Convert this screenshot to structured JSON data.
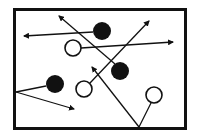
{
  "diagram": {
    "width": 197,
    "height": 136,
    "stroke_color": "#111111",
    "background": "#ffffff",
    "frame": {
      "x": 14.5,
      "y": 9.5,
      "width": 171,
      "height": 119,
      "stroke_width": 3
    },
    "filled_circles": [
      {
        "id": "filled-top",
        "cx": 102,
        "cy": 31,
        "r": 9
      },
      {
        "id": "filled-middle",
        "cx": 120,
        "cy": 71,
        "r": 9
      },
      {
        "id": "filled-left",
        "cx": 55,
        "cy": 84,
        "r": 9
      }
    ],
    "open_circles": [
      {
        "id": "open-top",
        "cx": 73,
        "cy": 48,
        "r": 8
      },
      {
        "id": "open-lower-middle",
        "cx": 84,
        "cy": 89,
        "r": 8
      },
      {
        "id": "open-right",
        "cx": 154,
        "cy": 95,
        "r": 8
      }
    ],
    "arrows": [
      {
        "id": "arrow-top-left",
        "x1": 93,
        "y1": 32,
        "x2": 24,
        "y2": 36,
        "head": true
      },
      {
        "id": "arrow-diagonal-upleft",
        "x1": 115,
        "y1": 64,
        "x2": 59,
        "y2": 16,
        "head": true
      },
      {
        "id": "arrow-right-horizontal",
        "x1": 81,
        "y1": 48,
        "x2": 173,
        "y2": 42,
        "head": true
      },
      {
        "id": "arrow-up-right",
        "x1": 90,
        "y1": 83,
        "x2": 149,
        "y2": 21,
        "head": true
      },
      {
        "id": "line-left-to-filled",
        "x1": 16,
        "y1": 92,
        "x2": 46,
        "y2": 86,
        "head": false
      },
      {
        "id": "arrow-left-lower",
        "x1": 16,
        "y1": 92,
        "x2": 74,
        "y2": 109,
        "head": true
      },
      {
        "id": "arrow-bottom-upleft",
        "x1": 139,
        "y1": 127,
        "x2": 92,
        "y2": 67,
        "head": true
      },
      {
        "id": "line-bottom-to-open-right",
        "x1": 139,
        "y1": 127,
        "x2": 151,
        "y2": 103,
        "head": false
      }
    ]
  }
}
